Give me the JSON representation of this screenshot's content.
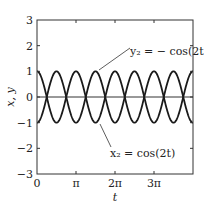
{
  "chart_data": {
    "type": "line",
    "title": "",
    "xlabel": "t",
    "ylabel": "x, y",
    "xlim": [
      0,
      12.566
    ],
    "ylim": [
      -3,
      3
    ],
    "grid": false,
    "legend": null,
    "x_ticks": [
      {
        "value": 0,
        "label": "0"
      },
      {
        "value": 3.14159,
        "label": "π"
      },
      {
        "value": 6.28319,
        "label": "2π"
      },
      {
        "value": 9.42478,
        "label": "3π"
      }
    ],
    "y_ticks": [
      {
        "value": 3,
        "label": "3"
      },
      {
        "value": 2,
        "label": "2"
      },
      {
        "value": 1,
        "label": "1"
      },
      {
        "value": 0,
        "label": "0"
      },
      {
        "value": -1,
        "label": "−1"
      },
      {
        "value": -2,
        "label": "−2"
      },
      {
        "value": -3,
        "label": "−3"
      }
    ],
    "series": [
      {
        "name": "x₂ = cos(2t)",
        "function": "cos(2t)",
        "amplitude": 1,
        "angular_frequency": 2,
        "phase_sign": 1
      },
      {
        "name": "y₂ = − cos(2t)",
        "function": "-cos(2t)",
        "amplitude": 1,
        "angular_frequency": 2,
        "phase_sign": -1
      }
    ],
    "reference_lines": [
      {
        "type": "horizontal",
        "y": 0
      }
    ],
    "annotations": [
      {
        "text": "y₂ = − cos(2t)",
        "target_series": 1,
        "point_t": 4.712,
        "point_y": 1
      },
      {
        "text": "x₂ = cos(2t)",
        "target_series": 0,
        "point_t": 4.712,
        "point_y": -1
      }
    ],
    "colors": {
      "curve": "#1a1a1a",
      "axis": "#333333",
      "zero_line": "#333333",
      "text": "#222222"
    }
  }
}
